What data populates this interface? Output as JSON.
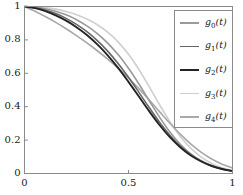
{
  "chart_data": {
    "type": "line",
    "title": "",
    "xlabel": "",
    "ylabel": "",
    "xlim": [
      0,
      1
    ],
    "ylim": [
      0,
      1
    ],
    "xticks": [
      "0",
      "0.5",
      "1"
    ],
    "xtick_values": [
      0,
      0.5,
      1
    ],
    "yticks": [
      "0",
      "0.2",
      "0.4",
      "0.6",
      "0.8",
      "1"
    ],
    "ytick_values": [
      0,
      0.2,
      0.4,
      0.6,
      0.8,
      1
    ],
    "grid": false,
    "legend_position": "upper right",
    "x": [
      0,
      0.05,
      0.1,
      0.15,
      0.2,
      0.25,
      0.3,
      0.35,
      0.4,
      0.45,
      0.5,
      0.55,
      0.6,
      0.65,
      0.7,
      0.75,
      0.8,
      0.85,
      0.9,
      0.95,
      1
    ],
    "series": [
      {
        "name": "g_0(t)",
        "label": "g0(t)",
        "color": "#9a9a9a",
        "width": 1.6,
        "values": [
          1.0,
          0.996,
          0.987,
          0.972,
          0.95,
          0.921,
          0.884,
          0.838,
          0.781,
          0.712,
          0.63,
          0.536,
          0.435,
          0.336,
          0.247,
          0.174,
          0.118,
          0.076,
          0.046,
          0.026,
          0.014
        ]
      },
      {
        "name": "g_1(t)",
        "label": "g1(t)",
        "color": "#666666",
        "width": 1.6,
        "values": [
          1.0,
          0.993,
          0.979,
          0.958,
          0.929,
          0.893,
          0.849,
          0.796,
          0.733,
          0.659,
          0.576,
          0.486,
          0.394,
          0.306,
          0.228,
          0.163,
          0.112,
          0.074,
          0.046,
          0.027,
          0.015
        ]
      },
      {
        "name": "g_2(t)",
        "label": "g2(t)",
        "color": "#242424",
        "width": 1.9,
        "values": [
          1.0,
          0.99,
          0.972,
          0.947,
          0.915,
          0.876,
          0.829,
          0.773,
          0.708,
          0.633,
          0.549,
          0.461,
          0.372,
          0.289,
          0.216,
          0.156,
          0.108,
          0.072,
          0.045,
          0.027,
          0.015
        ]
      },
      {
        "name": "g_3(t)",
        "label": "g3(t)",
        "color": "#d0d0d0",
        "width": 1.7,
        "values": [
          1.0,
          0.998,
          0.993,
          0.984,
          0.97,
          0.951,
          0.925,
          0.891,
          0.846,
          0.788,
          0.714,
          0.623,
          0.519,
          0.41,
          0.308,
          0.22,
          0.15,
          0.098,
          0.06,
          0.034,
          0.018
        ]
      },
      {
        "name": "g_4(t)",
        "label": "g4(t)",
        "color": "#a8a8a8",
        "width": 1.6,
        "values": [
          1.0,
          0.972,
          0.94,
          0.905,
          0.867,
          0.826,
          0.782,
          0.735,
          0.685,
          0.631,
          0.572,
          0.508,
          0.44,
          0.369,
          0.299,
          0.234,
          0.176,
          0.127,
          0.087,
          0.056,
          0.034
        ]
      }
    ]
  },
  "legend": {
    "entries": [
      {
        "label_base": "g",
        "label_sub": "0",
        "label_arg": "(t)"
      },
      {
        "label_base": "g",
        "label_sub": "1",
        "label_arg": "(t)"
      },
      {
        "label_base": "g",
        "label_sub": "2",
        "label_arg": "(t)"
      },
      {
        "label_base": "g",
        "label_sub": "3",
        "label_arg": "(t)"
      },
      {
        "label_base": "g",
        "label_sub": "4",
        "label_arg": "(t)"
      }
    ]
  },
  "axes": {
    "frame_color": "#8a8a8a",
    "tick_color": "#8a8a8a",
    "background": "#ffffff"
  }
}
